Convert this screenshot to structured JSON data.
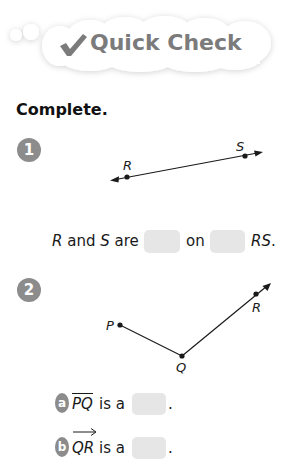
{
  "header": {
    "title": "Quick Check",
    "icon": "checkmark-icon"
  },
  "section_title": "Complete.",
  "colors": {
    "badge": "#8c8c8c",
    "blank": "#e6e6e6",
    "title_gray": "#7b7b7b",
    "cloud": "#ffffff"
  },
  "problems": [
    {
      "number": "1",
      "figure": {
        "type": "line",
        "points": [
          {
            "label": "R",
            "x": 127,
            "y": 177
          },
          {
            "label": "S",
            "x": 245,
            "y": 156
          }
        ]
      },
      "sentence": {
        "part1_var": "R",
        "part1_text": " and ",
        "part2_var": "S",
        "part2_text": " are",
        "middle_text": "on",
        "end_var": "RS",
        "end_punct": "."
      }
    },
    {
      "number": "2",
      "figure": {
        "type": "segment-and-ray",
        "points": [
          {
            "label": "P",
            "x": 120,
            "y": 325
          },
          {
            "label": "Q",
            "x": 182,
            "y": 356
          },
          {
            "label": "R",
            "x": 256,
            "y": 294
          }
        ]
      },
      "parts": [
        {
          "letter": "a",
          "notation": "PQ",
          "symbol": "segment",
          "text": "is a",
          "punct": "."
        },
        {
          "letter": "b",
          "notation": "QR",
          "symbol": "ray",
          "text": "is a",
          "punct": "."
        }
      ]
    }
  ]
}
